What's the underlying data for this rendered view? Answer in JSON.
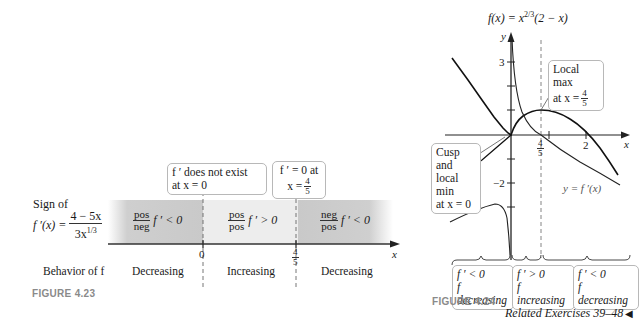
{
  "figure_4_23": {
    "caption": "FIGURE 4.23",
    "sign_label_line1": "Sign of",
    "sign_label_lhs": "f ′(x) =",
    "sign_label_num": "4 − 5x",
    "sign_label_den": "3x",
    "sign_label_den_exp": "1/3",
    "behavior_label": "Behavior of f",
    "callout_zero": {
      "line1": "f ′ does not exist",
      "line2": "at x = 0"
    },
    "callout_four_fifths": {
      "line1": "f ′ = 0 at",
      "line2_prefix": "x =",
      "num": "4",
      "den": "5"
    },
    "regions": [
      {
        "num": "pos",
        "den": "neg",
        "sign": "f ′ < 0",
        "behavior": "Decreasing"
      },
      {
        "num": "pos",
        "den": "pos",
        "sign": "f ′ > 0",
        "behavior": "Increasing"
      },
      {
        "num": "neg",
        "den": "pos",
        "sign": "f ′ < 0",
        "behavior": "Decreasing"
      }
    ],
    "axis": {
      "tick_zero": "0",
      "tick_num": "4",
      "tick_den": "5",
      "x_label": "x"
    },
    "colors": {
      "dark_band": "#c9c9c9",
      "light_band": "#eeeeee"
    }
  },
  "figure_4_24": {
    "caption": "FIGURE 4.24",
    "function_label": "f(x) = x^(2/3)(2 − x)",
    "function_label_prefix": "f(x) = x",
    "function_label_exp": "2/3",
    "function_label_suffix": "(2 − x)",
    "derivative_label": "y = f ′(x)",
    "y_axis_label": "y",
    "x_axis_label": "x",
    "y_tick_3": "3",
    "y_tick_neg2": "−2",
    "x_tick_2": "2",
    "x_tick_num": "4",
    "x_tick_den": "5",
    "callout_local_max": {
      "line1": "Local max",
      "line2_prefix": "at x =",
      "num": "4",
      "den": "5"
    },
    "callout_cusp": {
      "line1": "Cusp and",
      "line2": "local min",
      "line3": "at x = 0"
    },
    "interval_boxes": [
      {
        "line1": "f ′ < 0",
        "line2": "f decreasing"
      },
      {
        "line1": "f ′ > 0",
        "line2": "f increasing"
      },
      {
        "line1": "f ′ < 0",
        "line2": "f decreasing"
      }
    ]
  },
  "footer": {
    "related_exercises": "Related Exercises 39–48",
    "end_marker": "◀"
  }
}
